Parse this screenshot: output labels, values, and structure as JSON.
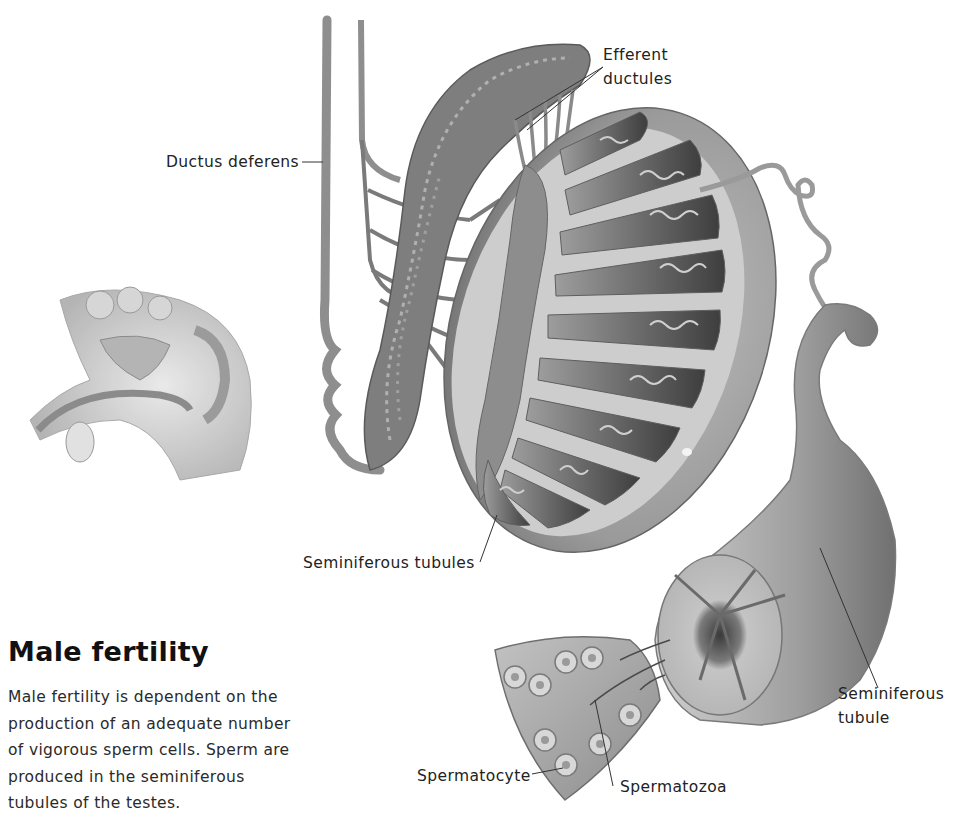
{
  "figure": {
    "title": "Male fertility",
    "caption_lines": [
      "Male fertility is dependent on the",
      "production of an adequate number",
      "of vigorous sperm cells. Sperm are",
      "produced in the seminiferous",
      "tubules of the testes."
    ],
    "labels": {
      "efferent_line1": "Efferent",
      "efferent_line2": "ductules",
      "ductus_deferens": "Ductus deferens",
      "seminiferous_tubules": "Seminiferous tubules",
      "seminiferous_tubule_line1": "Seminiferous",
      "seminiferous_tubule_line2": "tubule",
      "spermatocyte": "Spermatocyte",
      "spermatozoa": "Spermatozoa"
    },
    "colors": {
      "background": "#ffffff",
      "ink": "#1a1a1a",
      "tissue_dark": "#4a4a4a",
      "tissue_mid": "#8a8a8a",
      "tissue_light": "#c8c8c8"
    }
  }
}
